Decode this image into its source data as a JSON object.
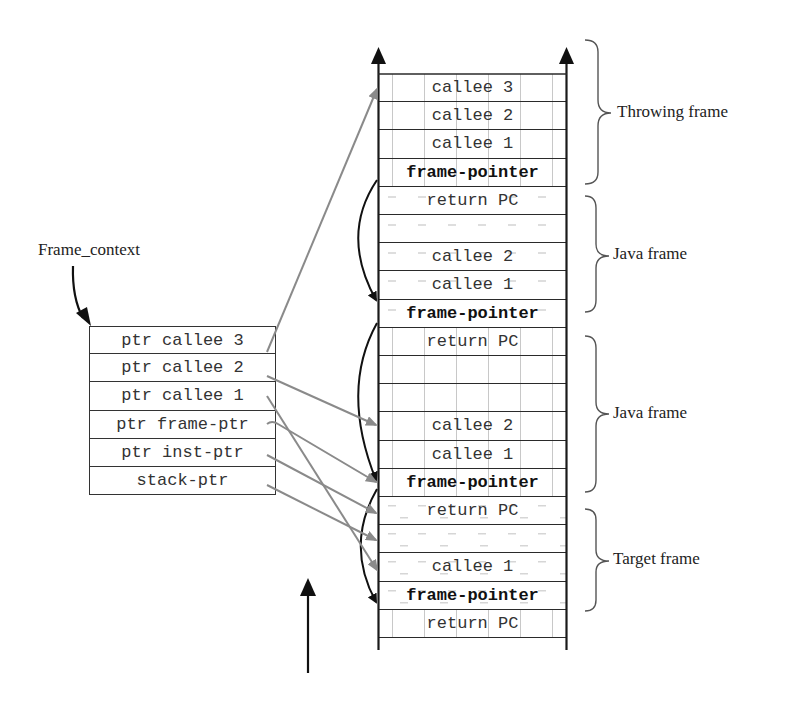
{
  "diagram": {
    "context_label": "Frame_context",
    "frame_context": [
      {
        "label": "ptr callee 3"
      },
      {
        "label": "ptr callee 2"
      },
      {
        "label": "ptr callee 1"
      },
      {
        "label": "ptr frame-ptr"
      },
      {
        "label": "ptr inst-ptr"
      },
      {
        "label": "stack-ptr"
      }
    ],
    "stack": [
      {
        "label": "callee 3",
        "bold": false,
        "shade": "vdash"
      },
      {
        "label": "callee 2",
        "bold": false,
        "shade": "vdash"
      },
      {
        "label": "callee 1",
        "bold": false,
        "shade": "vdash"
      },
      {
        "label": "frame-pointer",
        "bold": true,
        "shade": "vdash"
      },
      {
        "label": "return PC",
        "bold": false,
        "shade": "hdash"
      },
      {
        "label": "",
        "bold": false,
        "shade": "hdash"
      },
      {
        "label": "callee 2",
        "bold": false,
        "shade": "hdash"
      },
      {
        "label": "callee 1",
        "bold": false,
        "shade": "hdash"
      },
      {
        "label": "frame-pointer",
        "bold": true,
        "shade": "hdash"
      },
      {
        "label": "return PC",
        "bold": false,
        "shade": "vdash"
      },
      {
        "label": "",
        "bold": false,
        "shade": "vdash"
      },
      {
        "label": "",
        "bold": false,
        "shade": "vdash"
      },
      {
        "label": "callee 2",
        "bold": false,
        "shade": "vdash"
      },
      {
        "label": "callee 1",
        "bold": false,
        "shade": "vdash"
      },
      {
        "label": "frame-pointer",
        "bold": true,
        "shade": "vdash"
      },
      {
        "label": "return PC",
        "bold": false,
        "shade": "hdash2"
      },
      {
        "label": "",
        "bold": false,
        "shade": "hdash2"
      },
      {
        "label": "callee 1",
        "bold": false,
        "shade": "hdash2"
      },
      {
        "label": "frame-pointer",
        "bold": true,
        "shade": "hdash2"
      },
      {
        "label": "return PC",
        "bold": false,
        "shade": "vdash"
      }
    ],
    "frames": [
      {
        "label": "Throwing frame"
      },
      {
        "label": "Java frame"
      },
      {
        "label": "Java frame"
      },
      {
        "label": "Target frame"
      }
    ],
    "colors": {
      "line": "#1a1a1a",
      "pointer_arrow": "#8a8a8a",
      "chain_arrow": "#111111"
    }
  }
}
